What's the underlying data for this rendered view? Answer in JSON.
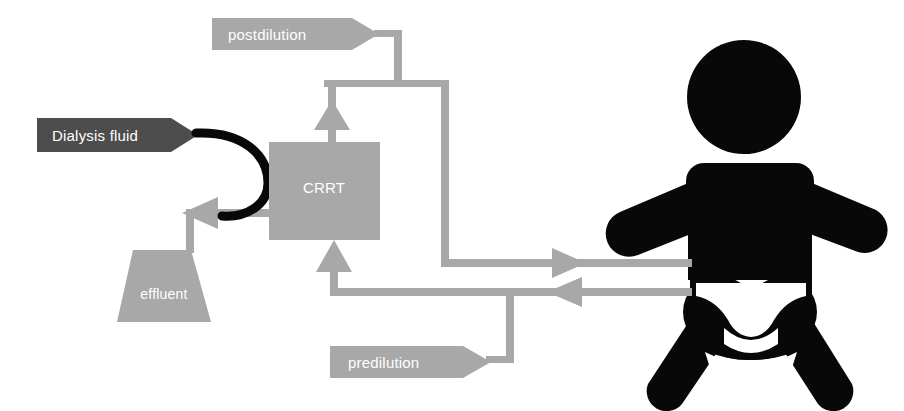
{
  "diagram": {
    "colors": {
      "light_gray": "#a8a8a8",
      "dark_gray": "#4d4d4d",
      "black": "#080808",
      "white": "#ffffff",
      "background": "#ffffff"
    },
    "nodes": [
      {
        "id": "postdilution",
        "label": "postdilution",
        "shape": "pentagon-banner",
        "fill": "light_gray",
        "text_color": "white"
      },
      {
        "id": "dialysis_fluid",
        "label": "Dialysis fluid",
        "shape": "pentagon-banner",
        "fill": "dark_gray",
        "text_color": "white"
      },
      {
        "id": "crrt",
        "label": "CRRT",
        "shape": "rectangle",
        "fill": "light_gray",
        "text_color": "white"
      },
      {
        "id": "effluent",
        "label": "effluent",
        "shape": "trapezoid",
        "fill": "light_gray",
        "text_color": "white"
      },
      {
        "id": "predilution",
        "label": "predilution",
        "shape": "pentagon-banner",
        "fill": "light_gray",
        "text_color": "white"
      },
      {
        "id": "patient",
        "label": "",
        "shape": "infant-silhouette",
        "fill": "black",
        "text_color": "none"
      }
    ],
    "connections": [
      {
        "id": "postdilution-to-return-line",
        "from": "postdilution",
        "to": "return-line",
        "arrow": false
      },
      {
        "id": "return-line-to-crrt-top",
        "from": "return-line",
        "to": "crrt",
        "arrow": true,
        "direction": "up"
      },
      {
        "id": "crrt-to-effluent",
        "from": "crrt",
        "to": "effluent",
        "arrow": true,
        "direction": "left"
      },
      {
        "id": "dialysis-fluid-to-crrt",
        "from": "dialysis_fluid",
        "to": "crrt",
        "arrow": false,
        "style": "curved-tube"
      },
      {
        "id": "crrt-to-patient-inflow",
        "from": "crrt",
        "to": "patient",
        "arrow": true,
        "direction": "right"
      },
      {
        "id": "patient-to-crrt-outflow",
        "from": "patient",
        "to": "crrt",
        "arrow": true,
        "direction": "left"
      },
      {
        "id": "predilution-to-access-line",
        "from": "predilution",
        "to": "access-line",
        "arrow": false
      },
      {
        "id": "access-line-to-crrt-bottom",
        "from": "access-line",
        "to": "crrt",
        "arrow": true,
        "direction": "up"
      }
    ]
  }
}
